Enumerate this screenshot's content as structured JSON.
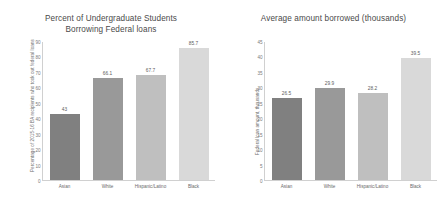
{
  "chart_data": [
    {
      "type": "bar",
      "panel": "left",
      "title_line1": "Percent of Undergraduate Students",
      "title_line2": "Borrowing Federal loans",
      "title": "Percent of Undergraduate Students Borrowing Federal loans",
      "xlabel": "",
      "ylabel": "Percentage of 2015-16 BA recipients who took out federal loans",
      "ylim": [
        0,
        90
      ],
      "yticks": [
        90,
        80,
        70,
        60,
        50,
        40,
        30,
        20,
        10,
        0
      ],
      "grid": false,
      "legend": "none",
      "categories": [
        "Asian",
        "White",
        "Hispanic/Latino",
        "Black"
      ],
      "values": [
        43,
        66.1,
        67.7,
        85.7
      ],
      "value_labels": [
        "43",
        "66.1",
        "67.7",
        "85.7"
      ],
      "bar_colors": [
        "#808080",
        "#999999",
        "#bfbfbf",
        "#d9d9d9"
      ]
    },
    {
      "type": "bar",
      "panel": "right",
      "title_line1": "Average amount borrowed (thousands)",
      "title_line2": "",
      "title": "Average amount borrowed (thousands)",
      "xlabel": "",
      "ylabel": "Federal loan amount, thousands",
      "ylim": [
        0,
        45
      ],
      "yticks": [
        45,
        40,
        35,
        30,
        25,
        20,
        15,
        10,
        5,
        0
      ],
      "grid": false,
      "legend": "none",
      "categories": [
        "Asian",
        "White",
        "Hispanic/Latino",
        "Black"
      ],
      "values": [
        26.5,
        29.9,
        28.2,
        39.5
      ],
      "value_labels": [
        "26.5",
        "29.9",
        "28.2",
        "39.5"
      ],
      "bar_colors": [
        "#808080",
        "#999999",
        "#bfbfbf",
        "#d9d9d9"
      ]
    }
  ]
}
